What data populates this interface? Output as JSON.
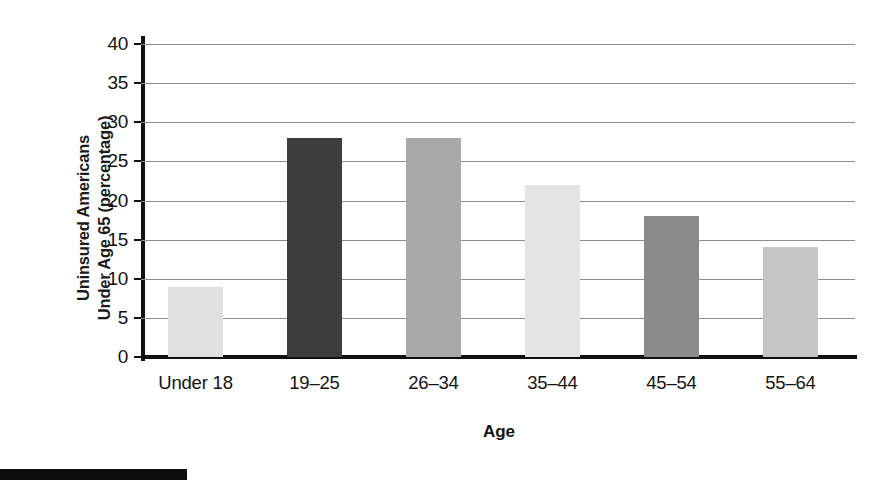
{
  "chart_data": {
    "type": "bar",
    "title": "",
    "categories": [
      "Under 18",
      "19–25",
      "26–34",
      "35–44",
      "45–54",
      "55–64"
    ],
    "values": [
      9,
      28,
      28,
      22,
      18,
      14
    ],
    "bar_colors": [
      "#e0e0e0",
      "#3d3d3d",
      "#a9a9a9",
      "#e4e4e4",
      "#8b8b8b",
      "#c5c5c5"
    ],
    "xlabel": "Age",
    "ylabel_line1": "Uninsured Americans",
    "ylabel_line2": "Under Age 65 (percentage)",
    "ylim": [
      0,
      40
    ],
    "ytick_step": 5,
    "yticks": [
      "0",
      "5",
      "10",
      "15",
      "20",
      "25",
      "30",
      "35",
      "40"
    ],
    "grid": true,
    "grid_axis": "y",
    "legend": false,
    "legend_position": "none",
    "axis_color": "#111111",
    "gridline_color": "#8d8d8d",
    "background_color": "#ffffff"
  },
  "figure": {
    "footer_rule_color": "#0d0d0d"
  }
}
